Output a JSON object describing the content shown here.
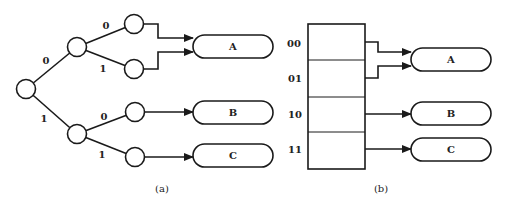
{
  "figure": {
    "panel_a": {
      "caption": "(a)",
      "type": "binary-tree",
      "edge_labels": {
        "root_to_upper": "0",
        "root_to_lower": "1",
        "upper_to_leaf0": "0",
        "upper_to_leaf1": "1",
        "lower_to_leaf0": "0",
        "lower_to_leaf1": "1"
      },
      "targets": [
        {
          "label": "A"
        },
        {
          "label": "B"
        },
        {
          "label": "C"
        }
      ]
    },
    "panel_b": {
      "caption": "(b)",
      "type": "lookup-table",
      "rows": [
        {
          "index": "00",
          "target": "A"
        },
        {
          "index": "01",
          "target": "A"
        },
        {
          "index": "10",
          "target": "B"
        },
        {
          "index": "11",
          "target": "C"
        }
      ],
      "targets": [
        {
          "label": "A"
        },
        {
          "label": "B"
        },
        {
          "label": "C"
        }
      ]
    }
  }
}
